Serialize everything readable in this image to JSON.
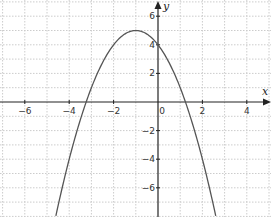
{
  "chart_data": {
    "type": "line",
    "title": "",
    "xlabel": "x",
    "ylabel": "y",
    "xlim": [
      -7.1,
      5.1
    ],
    "ylim": [
      -8,
      7.1
    ],
    "grid": true,
    "grid_style": "dotted",
    "x_ticks": [
      -6,
      -4,
      -2,
      0,
      2,
      4
    ],
    "y_ticks": [
      -6,
      -4,
      -2,
      2,
      4,
      6
    ],
    "x_tick_labels": [
      "−6",
      "−4",
      "−2",
      "0",
      "2",
      "4"
    ],
    "y_tick_labels": [
      "−6",
      "−4",
      "−2",
      "2",
      "4",
      "6"
    ],
    "series": [
      {
        "name": "parabola",
        "equation": "y = -(x+1)^2 + 5",
        "vertex": [
          -1,
          5
        ],
        "y_intercept": 4,
        "roots": [
          -3.236,
          1.236
        ],
        "x_range": [
          -4.6,
          2.6
        ],
        "color": "#555555",
        "x": [
          -4.6,
          -4,
          -3.236,
          -3,
          -2,
          -1,
          0,
          1,
          1.236,
          2,
          2.6
        ],
        "y": [
          -7.96,
          -4,
          0,
          1,
          4,
          5,
          4,
          1,
          0,
          -4,
          -7.96
        ]
      }
    ],
    "legend": null
  },
  "colors": {
    "axis": "#222222",
    "grid": "#cccccc",
    "curve": "#555555",
    "background": "#ffffff"
  }
}
